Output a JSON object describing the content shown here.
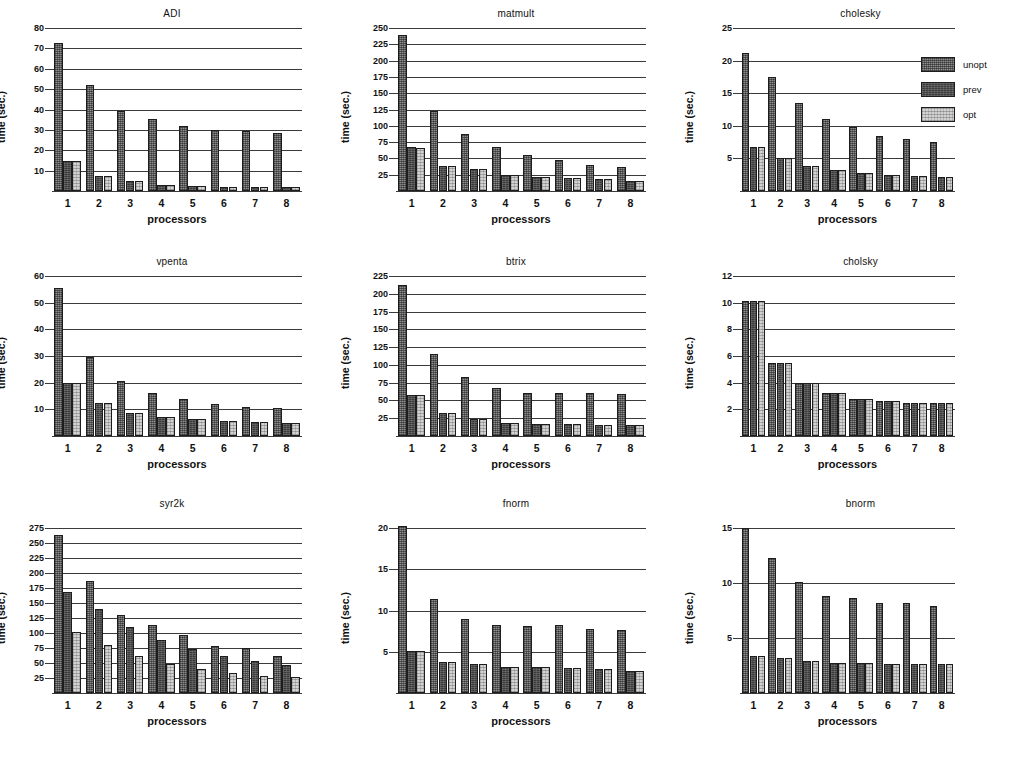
{
  "figure": {
    "series_names": [
      "unopt",
      "prev",
      "opt"
    ],
    "series_colors": [
      "#8d8d8d",
      "#3b3b3b",
      "#d2d2d2"
    ],
    "axis_labels": {
      "x": "processors",
      "y": "time (sec.)"
    },
    "categories": [
      "1",
      "2",
      "3",
      "4",
      "5",
      "6",
      "7",
      "8"
    ]
  },
  "legend": {
    "position": "top-right",
    "items": [
      {
        "label": "unopt",
        "color": "#8d8d8d"
      },
      {
        "label": "prev",
        "color": "#3b3b3b"
      },
      {
        "label": "opt",
        "color": "#d2d2d2"
      }
    ]
  },
  "chart_data": [
    {
      "type": "bar",
      "title": "ADI",
      "xlabel": "processors",
      "ylabel": "time (sec.)",
      "categories": [
        "1",
        "2",
        "3",
        "4",
        "5",
        "6",
        "7",
        "8"
      ],
      "ylim": [
        0,
        80
      ],
      "yticks": [
        10,
        20,
        30,
        40,
        50,
        60,
        70,
        80
      ],
      "grid": true,
      "legend_position": "none",
      "series": [
        {
          "name": "unopt",
          "values": [
            72.5,
            52.0,
            39.5,
            35.5,
            32.0,
            30.0,
            29.5,
            28.5
          ]
        },
        {
          "name": "prev",
          "values": [
            14.5,
            7.5,
            5.0,
            3.0,
            2.5,
            2.0,
            2.0,
            2.0
          ]
        },
        {
          "name": "opt",
          "values": [
            14.5,
            7.5,
            5.0,
            3.0,
            2.5,
            2.0,
            2.0,
            2.0
          ]
        }
      ]
    },
    {
      "type": "bar",
      "title": "matmult",
      "xlabel": "processors",
      "ylabel": "time (sec.)",
      "categories": [
        "1",
        "2",
        "3",
        "4",
        "5",
        "6",
        "7",
        "8"
      ],
      "ylim": [
        0,
        250
      ],
      "yticks": [
        25,
        50,
        75,
        100,
        125,
        150,
        175,
        200,
        225,
        250
      ],
      "grid": true,
      "legend_position": "none",
      "series": [
        {
          "name": "unopt",
          "values": [
            239,
            123,
            87,
            68,
            55,
            48,
            40,
            37
          ]
        },
        {
          "name": "prev",
          "values": [
            67,
            38,
            33,
            24,
            22,
            20,
            18,
            15
          ]
        },
        {
          "name": "opt",
          "values": [
            66,
            38,
            33,
            24,
            21,
            20,
            18,
            15
          ]
        }
      ]
    },
    {
      "type": "bar",
      "title": "cholesky",
      "xlabel": "processors",
      "ylabel": "time (sec.)",
      "categories": [
        "1",
        "2",
        "3",
        "4",
        "5",
        "6",
        "7",
        "8"
      ],
      "ylim": [
        0,
        25
      ],
      "yticks": [
        5,
        10,
        15,
        20,
        25
      ],
      "grid": true,
      "legend_position": "top-right",
      "series": [
        {
          "name": "unopt",
          "values": [
            21.2,
            17.5,
            13.5,
            11.0,
            9.8,
            8.5,
            8.0,
            7.5
          ]
        },
        {
          "name": "prev",
          "values": [
            6.8,
            5.0,
            3.8,
            3.2,
            2.8,
            2.5,
            2.3,
            2.2
          ]
        },
        {
          "name": "opt",
          "values": [
            6.8,
            5.0,
            3.8,
            3.2,
            2.8,
            2.5,
            2.3,
            2.2
          ]
        }
      ]
    },
    {
      "type": "bar",
      "title": "vpenta",
      "xlabel": "processors",
      "ylabel": "time (sec.)",
      "categories": [
        "1",
        "2",
        "3",
        "4",
        "5",
        "6",
        "7",
        "8"
      ],
      "ylim": [
        0,
        60
      ],
      "yticks": [
        10,
        20,
        30,
        40,
        50,
        60
      ],
      "grid": true,
      "legend_position": "none",
      "series": [
        {
          "name": "unopt",
          "values": [
            55.5,
            29.8,
            20.5,
            16.0,
            13.8,
            12.0,
            10.8,
            10.5
          ]
        },
        {
          "name": "prev",
          "values": [
            20.0,
            12.2,
            8.5,
            7.0,
            6.2,
            5.8,
            5.2,
            5.0
          ]
        },
        {
          "name": "opt",
          "values": [
            20.0,
            12.2,
            8.5,
            7.0,
            6.2,
            5.8,
            5.2,
            5.0
          ]
        }
      ]
    },
    {
      "type": "bar",
      "title": "btrix",
      "xlabel": "processors",
      "ylabel": "time (sec.)",
      "categories": [
        "1",
        "2",
        "3",
        "4",
        "5",
        "6",
        "7",
        "8"
      ],
      "ylim": [
        0,
        225
      ],
      "yticks": [
        25,
        50,
        75,
        100,
        125,
        150,
        175,
        200,
        225
      ],
      "grid": true,
      "legend_position": "none",
      "series": [
        {
          "name": "unopt",
          "values": [
            213,
            116,
            83,
            68,
            61,
            61,
            60,
            59
          ]
        },
        {
          "name": "prev",
          "values": [
            58,
            32,
            24,
            19,
            17,
            17,
            16,
            15
          ]
        },
        {
          "name": "opt",
          "values": [
            58,
            32,
            24,
            19,
            17,
            17,
            16,
            15
          ]
        }
      ]
    },
    {
      "type": "bar",
      "title": "cholsky",
      "xlabel": "processors",
      "ylabel": "time (sec.)",
      "categories": [
        "1",
        "2",
        "3",
        "4",
        "5",
        "6",
        "7",
        "8"
      ],
      "ylim": [
        0,
        12
      ],
      "yticks": [
        2,
        4,
        6,
        8,
        10,
        12
      ],
      "grid": true,
      "legend_position": "none",
      "series": [
        {
          "name": "unopt",
          "values": [
            10.1,
            5.5,
            4.0,
            3.2,
            2.8,
            2.6,
            2.5,
            2.5
          ]
        },
        {
          "name": "prev",
          "values": [
            10.1,
            5.5,
            4.0,
            3.2,
            2.8,
            2.6,
            2.5,
            2.5
          ]
        },
        {
          "name": "opt",
          "values": [
            10.1,
            5.5,
            4.0,
            3.2,
            2.8,
            2.6,
            2.5,
            2.5
          ]
        }
      ]
    },
    {
      "type": "bar",
      "title": "syr2k",
      "xlabel": "processors",
      "ylabel": "time (sec.)",
      "categories": [
        "1",
        "2",
        "3",
        "4",
        "5",
        "6",
        "7",
        "8"
      ],
      "ylim": [
        0,
        275
      ],
      "yticks": [
        25,
        50,
        75,
        100,
        125,
        150,
        175,
        200,
        225,
        250,
        275
      ],
      "grid": true,
      "legend_position": "none",
      "series": [
        {
          "name": "unopt",
          "values": [
            263,
            187,
            130,
            114,
            97,
            79,
            75,
            62
          ]
        },
        {
          "name": "prev",
          "values": [
            168,
            140,
            110,
            88,
            73,
            61,
            53,
            47
          ]
        },
        {
          "name": "opt",
          "values": [
            102,
            80,
            61,
            49,
            40,
            33,
            28,
            26
          ]
        }
      ]
    },
    {
      "type": "bar",
      "title": "fnorm",
      "xlabel": "processors",
      "ylabel": "time (sec.)",
      "categories": [
        "1",
        "2",
        "3",
        "4",
        "5",
        "6",
        "7",
        "8"
      ],
      "ylim": [
        0,
        20
      ],
      "yticks": [
        5,
        10,
        15,
        20
      ],
      "grid": true,
      "legend_position": "none",
      "series": [
        {
          "name": "unopt",
          "values": [
            20.2,
            11.4,
            9.0,
            8.2,
            8.1,
            8.2,
            7.8,
            7.6
          ]
        },
        {
          "name": "prev",
          "values": [
            5.1,
            3.8,
            3.5,
            3.2,
            3.2,
            3.0,
            2.9,
            2.7
          ]
        },
        {
          "name": "opt",
          "values": [
            5.1,
            3.8,
            3.5,
            3.2,
            3.2,
            3.0,
            2.9,
            2.7
          ]
        }
      ]
    },
    {
      "type": "bar",
      "title": "bnorm",
      "xlabel": "processors",
      "ylabel": "time (sec.)",
      "categories": [
        "1",
        "2",
        "3",
        "4",
        "5",
        "6",
        "7",
        "8"
      ],
      "ylim": [
        0,
        15
      ],
      "yticks": [
        5,
        10,
        15
      ],
      "grid": true,
      "legend_position": "none",
      "series": [
        {
          "name": "unopt",
          "values": [
            15.0,
            12.3,
            10.1,
            8.8,
            8.6,
            8.2,
            8.2,
            7.9
          ]
        },
        {
          "name": "prev",
          "values": [
            3.4,
            3.2,
            2.9,
            2.7,
            2.7,
            2.6,
            2.6,
            2.6
          ]
        },
        {
          "name": "opt",
          "values": [
            3.4,
            3.2,
            2.9,
            2.7,
            2.7,
            2.6,
            2.6,
            2.6
          ]
        }
      ]
    }
  ]
}
